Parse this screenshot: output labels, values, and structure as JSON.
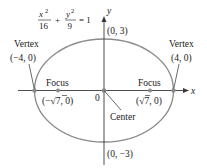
{
  "diagram": {
    "type": "ellipse",
    "equation": {
      "x_num": "x",
      "x_exp": "2",
      "x_den": "16",
      "plus": "+",
      "y_num": "y",
      "y_exp": "2",
      "y_den": "9",
      "rhs": "= 1"
    },
    "axes": {
      "x_label": "x",
      "y_label": "y",
      "origin_label": "0"
    },
    "points": {
      "top": "(0, 3)",
      "bottom": "(0, −3)",
      "left_vertex_title": "Vertex",
      "left_vertex_coord": "(−4, 0)",
      "right_vertex_title": "Vertex",
      "right_vertex_coord": "(4, 0)",
      "left_focus_title": "Focus",
      "left_focus_coord_open": "(−√",
      "left_focus_coord_rad": "7",
      "left_focus_coord_close": ", 0)",
      "right_focus_title": "Focus",
      "right_focus_coord_open": "(√",
      "right_focus_coord_rad": "7",
      "right_focus_coord_close": ", 0)",
      "center_title": "Center"
    },
    "colors": {
      "curve": "#8a8a8a",
      "axes": "#3a3a3a",
      "text": "#1a1a1a"
    }
  }
}
